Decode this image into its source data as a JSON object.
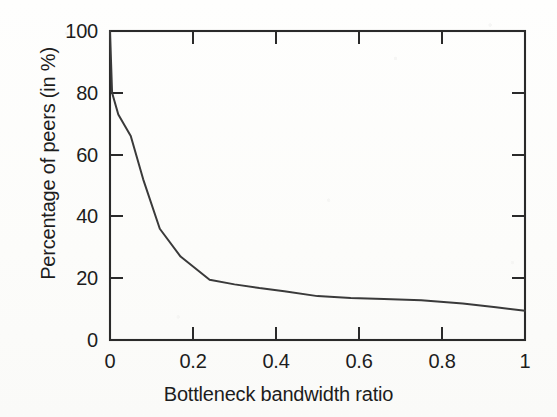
{
  "chart_data": {
    "type": "line",
    "title": "",
    "xlabel": "Bottleneck bandwidth ratio",
    "ylabel": "Percentage of peers (in %)",
    "xlim": [
      0,
      1
    ],
    "ylim": [
      0,
      100
    ],
    "grid": false,
    "legend": "none",
    "xticks": [
      "0",
      "0.2",
      "0.4",
      "0.6",
      "0.8",
      "1"
    ],
    "xtick_values": [
      0,
      0.2,
      0.4,
      0.6,
      0.8,
      1
    ],
    "yticks": [
      "0",
      "20",
      "40",
      "60",
      "80",
      "100"
    ],
    "ytick_values": [
      0,
      20,
      40,
      60,
      80,
      100
    ],
    "line_color": "#3a3a3a",
    "series": [
      {
        "name": "Percentage of peers",
        "x": [
          0,
          0.005,
          0.02,
          0.05,
          0.08,
          0.12,
          0.17,
          0.24,
          0.3,
          0.36,
          0.42,
          0.5,
          0.58,
          0.66,
          0.75,
          0.85,
          0.93,
          1
        ],
        "values": [
          100,
          80,
          73,
          66,
          52,
          36,
          27,
          19.5,
          18,
          16.8,
          15.8,
          14.2,
          13.6,
          13.3,
          12.9,
          11.8,
          10.6,
          9.5
        ]
      }
    ]
  },
  "axes": {
    "x_tick_labels": [
      "0",
      "0.2",
      "0.4",
      "0.6",
      "0.8",
      "1"
    ],
    "y_tick_labels": [
      "100",
      "80",
      "60",
      "40",
      "20",
      "0"
    ],
    "x_title": "Bottleneck bandwidth ratio",
    "y_title": "Percentage of peers (in %)"
  }
}
